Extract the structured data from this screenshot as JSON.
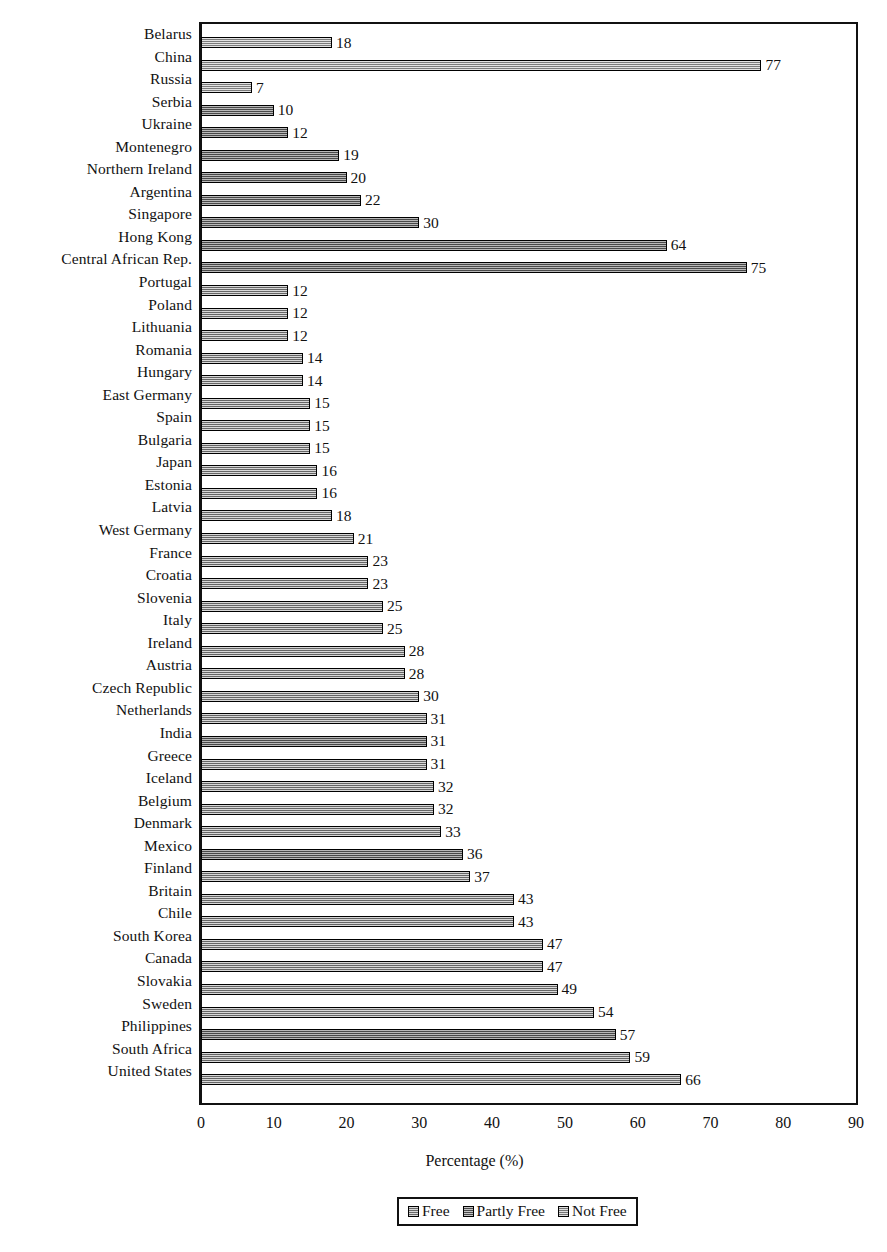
{
  "chart_data": {
    "type": "bar",
    "orientation": "horizontal",
    "title": "",
    "xlabel": "Percentage (%)",
    "ylabel": "",
    "xlim": [
      0,
      90
    ],
    "xticks": [
      0,
      10,
      20,
      30,
      40,
      50,
      60,
      70,
      80,
      90
    ],
    "grid": false,
    "legend_position": "bottom-center",
    "legend": [
      "Free",
      "Partly Free",
      "Not Free"
    ],
    "categories": [
      "Belarus",
      "China",
      "Russia",
      "Serbia",
      "Ukraine",
      "Montenegro",
      "Northern Ireland",
      "Argentina",
      "Singapore",
      "Hong Kong",
      "Central African Rep.",
      "Portugal",
      "Poland",
      "Lithuania",
      "Romania",
      "Hungary",
      "East Germany",
      "Spain",
      "Bulgaria",
      "Japan",
      "Estonia",
      "Latvia",
      "West Germany",
      "France",
      "Croatia",
      "Slovenia",
      "Italy",
      "Ireland",
      "Austria",
      "Czech Republic",
      "Netherlands",
      "India",
      "Greece",
      "Iceland",
      "Belgium",
      "Denmark",
      "Mexico",
      "Finland",
      "Britain",
      "Chile",
      "South Korea",
      "Canada",
      "Slovakia",
      "Sweden",
      "Philippines",
      "South Africa",
      "United States"
    ],
    "values": [
      18,
      77,
      7,
      10,
      12,
      19,
      20,
      22,
      30,
      64,
      75,
      12,
      12,
      12,
      14,
      14,
      15,
      15,
      15,
      16,
      16,
      18,
      21,
      23,
      23,
      25,
      25,
      28,
      28,
      30,
      31,
      31,
      31,
      32,
      32,
      33,
      36,
      37,
      43,
      43,
      47,
      47,
      49,
      54,
      57,
      59,
      66
    ],
    "groups": [
      "notfree",
      "notfree",
      "notfree",
      "partly",
      "partly",
      "partly",
      "partly",
      "partly",
      "partly",
      "partly",
      "partly",
      "free",
      "free",
      "free",
      "free",
      "free",
      "free",
      "free",
      "free",
      "free",
      "free",
      "free",
      "free",
      "free",
      "free",
      "free",
      "free",
      "free",
      "free",
      "free",
      "free",
      "partly",
      "free",
      "free",
      "free",
      "free",
      "partly",
      "free",
      "free",
      "free",
      "free",
      "free",
      "free",
      "free",
      "partly",
      "free",
      "free"
    ]
  },
  "legend": {
    "items": [
      {
        "label": "Free",
        "key": "free"
      },
      {
        "label": "Partly Free",
        "key": "partly"
      },
      {
        "label": "Not Free",
        "key": "notfree"
      }
    ]
  },
  "axis": {
    "x_title": "Percentage (%)"
  }
}
